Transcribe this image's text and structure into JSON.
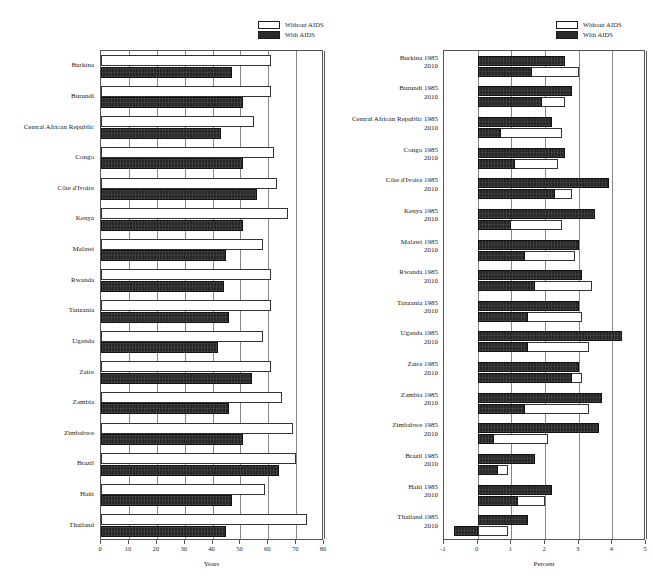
{
  "legend": {
    "items": [
      {
        "label": "Without AIDS",
        "swatch": "white",
        "color": "#ffffff"
      },
      {
        "label": "With AIDS",
        "swatch": "black",
        "color": "#262626"
      }
    ]
  },
  "chart_data": [
    {
      "id": "life-expectancy",
      "type": "bar",
      "orientation": "horizontal",
      "title": "",
      "xlabel": "Years",
      "ylabel": "",
      "xlim": [
        0,
        80
      ],
      "xticks": [
        0,
        10,
        20,
        30,
        40,
        50,
        60,
        70,
        80
      ],
      "xticklabels": [
        "0",
        "10",
        "20",
        "30",
        "40",
        "50",
        "60",
        "70",
        "80"
      ],
      "grid": true,
      "legend_position": "top-center",
      "categories": [
        "Burkina",
        "Burundi",
        "Central African Republic",
        "Congo",
        "Côte d'Ivoire",
        "Kenya",
        "Malawi",
        "Rwanda",
        "Tanzania",
        "Uganda",
        "Zaire",
        "Zambia",
        "Zimbabwe",
        "Brazil",
        "Haiti",
        "Thailand"
      ],
      "series": [
        {
          "name": "Without AIDS",
          "values": [
            61,
            61,
            55,
            62,
            63,
            67,
            58,
            61,
            61,
            58,
            61,
            65,
            69,
            70,
            59,
            74
          ]
        },
        {
          "name": "With AIDS",
          "values": [
            47,
            51,
            43,
            51,
            56,
            51,
            45,
            44,
            46,
            42,
            54,
            46,
            51,
            64,
            47,
            45
          ]
        }
      ]
    },
    {
      "id": "population-growth-rate",
      "type": "bar",
      "orientation": "horizontal",
      "title": "",
      "xlabel": "Percent",
      "ylabel": "",
      "xlim": [
        -1,
        5
      ],
      "xticks": [
        -1,
        0,
        1,
        2,
        3,
        4,
        5
      ],
      "xticklabels": [
        "-1",
        "0",
        "1",
        "2",
        "3",
        "4",
        "5"
      ],
      "grid": true,
      "legend_position": "top-center",
      "categories": [
        "Burkina",
        "Burundi",
        "Central African Republic",
        "Congo",
        "Côte d'Ivoire",
        "Kenya",
        "Malawi",
        "Rwanda",
        "Tanzania",
        "Uganda",
        "Zaire",
        "Zambia",
        "Zimbabwe",
        "Brazil",
        "Haiti",
        "Thailand"
      ],
      "year_labels": [
        "1985",
        "2010"
      ],
      "groups": [
        {
          "category": "Burkina",
          "y1985": {
            "without": 2.6,
            "with": 2.6
          },
          "y2010": {
            "without": 3.0,
            "with": 1.6
          }
        },
        {
          "category": "Burundi",
          "y1985": {
            "without": 2.8,
            "with": 2.8
          },
          "y2010": {
            "without": 2.6,
            "with": 1.9
          }
        },
        {
          "category": "Central African Republic",
          "y1985": {
            "without": 2.2,
            "with": 2.2
          },
          "y2010": {
            "without": 2.5,
            "with": 0.7
          }
        },
        {
          "category": "Congo",
          "y1985": {
            "without": 2.6,
            "with": 2.6
          },
          "y2010": {
            "without": 2.4,
            "with": 1.1
          }
        },
        {
          "category": "Côte d'Ivoire",
          "y1985": {
            "without": 3.9,
            "with": 3.9
          },
          "y2010": {
            "without": 2.8,
            "with": 2.3
          }
        },
        {
          "category": "Kenya",
          "y1985": {
            "without": 3.5,
            "with": 3.5
          },
          "y2010": {
            "without": 2.5,
            "with": 1.0
          }
        },
        {
          "category": "Malawi",
          "y1985": {
            "without": 3.0,
            "with": 3.0
          },
          "y2010": {
            "without": 2.9,
            "with": 1.4
          }
        },
        {
          "category": "Rwanda",
          "y1985": {
            "without": 3.1,
            "with": 3.1
          },
          "y2010": {
            "without": 3.4,
            "with": 1.7
          }
        },
        {
          "category": "Tanzania",
          "y1985": {
            "without": 3.0,
            "with": 3.0
          },
          "y2010": {
            "without": 3.1,
            "with": 1.5
          }
        },
        {
          "category": "Uganda",
          "y1985": {
            "without": 4.3,
            "with": 4.3
          },
          "y2010": {
            "without": 3.3,
            "with": 1.5
          }
        },
        {
          "category": "Zaire",
          "y1985": {
            "without": 3.0,
            "with": 3.0
          },
          "y2010": {
            "without": 3.1,
            "with": 2.8
          }
        },
        {
          "category": "Zambia",
          "y1985": {
            "without": 3.7,
            "with": 3.7
          },
          "y2010": {
            "without": 3.3,
            "with": 1.4
          }
        },
        {
          "category": "Zimbabwe",
          "y1985": {
            "without": 3.6,
            "with": 3.6
          },
          "y2010": {
            "without": 2.1,
            "with": 0.5
          }
        },
        {
          "category": "Brazil",
          "y1985": {
            "without": 1.7,
            "with": 1.7
          },
          "y2010": {
            "without": 0.9,
            "with": 0.6
          }
        },
        {
          "category": "Haiti",
          "y1985": {
            "without": 2.2,
            "with": 2.2
          },
          "y2010": {
            "without": 2.0,
            "with": 1.2
          }
        },
        {
          "category": "Thailand",
          "y1985": {
            "without": 1.5,
            "with": 1.5
          },
          "y2010": {
            "without": 0.9,
            "with": -0.7
          }
        }
      ]
    }
  ]
}
